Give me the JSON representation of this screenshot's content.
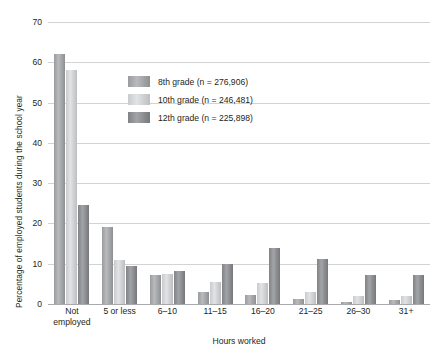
{
  "chart_data": {
    "type": "bar",
    "title": "",
    "xlabel": "Hours worked",
    "ylabel": "Percentage of employed students during the school year",
    "ylim": [
      0,
      70
    ],
    "ytick_step": 10,
    "yticks": [
      0,
      10,
      20,
      30,
      40,
      50,
      60,
      70
    ],
    "grid": true,
    "legend_position": "upper-center",
    "categories": [
      "Not\nemployed",
      "5 or less",
      "6–10",
      "11–15",
      "16–20",
      "21–25",
      "26–30",
      "31+"
    ],
    "series": [
      {
        "name": "8th grade (n = 276,906)",
        "color": "#9a9b9e",
        "values": [
          62.0,
          19.0,
          7.3,
          3.0,
          2.2,
          1.3,
          0.6,
          1.1
        ]
      },
      {
        "name": "10th grade (n = 246,481)",
        "color": "#cfd0d2",
        "values": [
          58.0,
          11.0,
          7.5,
          5.5,
          5.2,
          3.0,
          2.0,
          2.0
        ]
      },
      {
        "name": "12th grade (n = 225,898)",
        "color": "#808285",
        "values": [
          24.5,
          9.5,
          8.3,
          10.0,
          14.0,
          11.2,
          7.2,
          7.3
        ]
      }
    ]
  },
  "legend": {
    "entries": [
      "8th grade (n = 276,906)",
      "10th grade (n = 246,481)",
      "12th grade (n = 225,898)"
    ]
  },
  "axes": {
    "y_title": "Percentage of employed students during the school year",
    "x_title": "Hours worked",
    "ytick_labels": [
      "0",
      "10",
      "20",
      "30",
      "40",
      "50",
      "60",
      "70"
    ],
    "xtick_labels": [
      "Not employed",
      "5 or less",
      "6–10",
      "11–15",
      "16–20",
      "21–25",
      "26–30",
      "31+"
    ]
  }
}
